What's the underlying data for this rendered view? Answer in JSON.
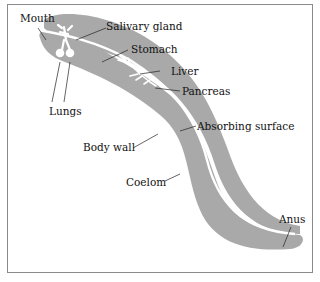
{
  "diagram": {
    "colors": {
      "body": "#a9a9a9",
      "gut_lumen": "#ffffff",
      "border": "#8a8a8a",
      "text": "#111111"
    },
    "labels": {
      "mouth": "Mouth",
      "salivary_gland": "Salivary gland",
      "stomach": "Stomach",
      "liver": "Liver",
      "pancreas": "Pancreas",
      "lungs": "Lungs",
      "absorbing_surface": "Absorbing surface",
      "body_wall": "Body wall",
      "coelom": "Coelom",
      "anus": "Anus"
    }
  }
}
